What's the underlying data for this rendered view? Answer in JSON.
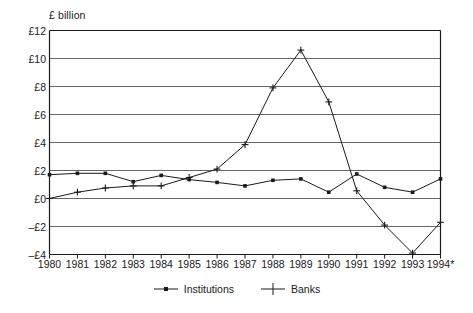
{
  "chart_data": {
    "type": "line",
    "title": "",
    "ylabel": "£ billion",
    "xlabel": "",
    "ylim": [
      -4,
      12
    ],
    "ytick_labels": [
      "£12",
      "£10",
      "£8",
      "£6",
      "£4",
      "£2",
      "£0",
      "–£2",
      "–£4"
    ],
    "ytick_values": [
      12,
      10,
      8,
      6,
      4,
      2,
      0,
      -2,
      -4
    ],
    "grid": true,
    "grid_axis": "y",
    "legend_position": "bottom",
    "categories": [
      "1980",
      "1981",
      "1982",
      "1983",
      "1984",
      "1985",
      "1986",
      "1987",
      "1988",
      "1989",
      "1990",
      "1991",
      "1992",
      "1993",
      "1994*"
    ],
    "x": [
      1980,
      1981,
      1982,
      1983,
      1984,
      1985,
      1986,
      1987,
      1988,
      1989,
      1990,
      1991,
      1992,
      1993,
      1994
    ],
    "series": [
      {
        "name": "Institutions",
        "marker": "dot",
        "values": [
          1.7,
          1.8,
          1.8,
          1.2,
          1.65,
          1.35,
          1.15,
          0.9,
          1.3,
          1.4,
          0.45,
          1.75,
          0.8,
          0.45,
          1.4
        ]
      },
      {
        "name": "Banks",
        "marker": "plus",
        "values": [
          0.0,
          0.45,
          0.75,
          0.9,
          0.9,
          1.5,
          2.1,
          3.85,
          7.9,
          10.6,
          6.9,
          0.55,
          -1.9,
          -3.9,
          -1.7
        ]
      }
    ],
    "colors": {
      "line": "#1a1a1a",
      "grid": "#666666",
      "axis": "#1a1a1a",
      "background": "#ffffff"
    }
  },
  "legend": {
    "items": [
      {
        "label": "Institutions",
        "marker": "dot"
      },
      {
        "label": "Banks",
        "marker": "plus"
      }
    ]
  }
}
